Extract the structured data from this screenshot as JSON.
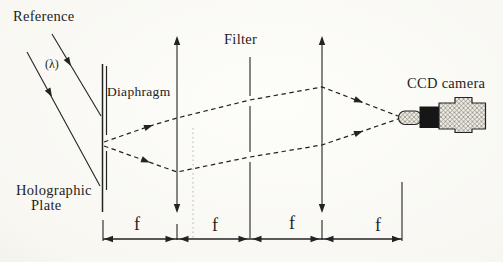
{
  "figure": {
    "type": "optical-setup-diagram",
    "description_labels": {
      "reference": "Reference",
      "wavelength": "(λ)",
      "diaphragm": "Diaphragm",
      "filter": "Filter",
      "ccd_camera": "CCD camera",
      "plate_line1": "Holographic",
      "plate_line2": "Plate"
    },
    "dimension": {
      "segment_labels": [
        "f",
        "f",
        "f",
        "f"
      ]
    },
    "colors": {
      "ink": "#232323",
      "paper": "#faf9f4",
      "camera_mount_black": "#161616",
      "camera_hatch_fill": "#edebe3",
      "camera_hatch_line": "#6b675f",
      "crease_gray": "#b0aca4"
    }
  }
}
